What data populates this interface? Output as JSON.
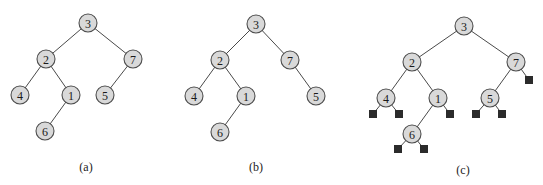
{
  "figure": {
    "style": {
      "node_fill": "#d9d9d9",
      "node_stroke": "#4d4d4d",
      "edge_color": "#4a4a4a",
      "null_leaf_color": "#2b2b2b",
      "node_radius": 9,
      "null_leaf_size": 8
    },
    "panels": [
      {
        "id": "a",
        "caption": "(a)",
        "caption_pos": [
          86,
          167
        ],
        "nodes": [
          {
            "id": "a3",
            "label": "3",
            "x": 88,
            "y": 23
          },
          {
            "id": "a2",
            "label": "2",
            "x": 46,
            "y": 59
          },
          {
            "id": "a7",
            "label": "7",
            "x": 133,
            "y": 59
          },
          {
            "id": "a4",
            "label": "4",
            "x": 20,
            "y": 95
          },
          {
            "id": "a1",
            "label": "1",
            "x": 71,
            "y": 95
          },
          {
            "id": "a5",
            "label": "5",
            "x": 105,
            "y": 95
          },
          {
            "id": "a6",
            "label": "6",
            "x": 45,
            "y": 131
          }
        ],
        "edges": [
          [
            "a3",
            "a2"
          ],
          [
            "a3",
            "a7"
          ],
          [
            "a2",
            "a4"
          ],
          [
            "a2",
            "a1"
          ],
          [
            "a7",
            "a5"
          ],
          [
            "a1",
            "a6"
          ]
        ],
        "null_leaves": []
      },
      {
        "id": "b",
        "caption": "(b)",
        "caption_pos": [
          256,
          167
        ],
        "nodes": [
          {
            "id": "b3",
            "label": "3",
            "x": 256,
            "y": 24
          },
          {
            "id": "b2",
            "label": "2",
            "x": 220,
            "y": 60
          },
          {
            "id": "b7",
            "label": "7",
            "x": 290,
            "y": 60
          },
          {
            "id": "b4",
            "label": "4",
            "x": 194,
            "y": 96
          },
          {
            "id": "b1",
            "label": "1",
            "x": 246,
            "y": 96
          },
          {
            "id": "b5",
            "label": "5",
            "x": 316,
            "y": 96
          },
          {
            "id": "b6",
            "label": "6",
            "x": 220,
            "y": 132
          }
        ],
        "edges": [
          [
            "b3",
            "b2"
          ],
          [
            "b3",
            "b7"
          ],
          [
            "b2",
            "b4"
          ],
          [
            "b2",
            "b1"
          ],
          [
            "b7",
            "b5"
          ],
          [
            "b1",
            "b6"
          ]
        ],
        "null_leaves": []
      },
      {
        "id": "c",
        "caption": "(c)",
        "caption_pos": [
          463,
          170
        ],
        "nodes": [
          {
            "id": "c3",
            "label": "3",
            "x": 464,
            "y": 26
          },
          {
            "id": "c2",
            "label": "2",
            "x": 412,
            "y": 62
          },
          {
            "id": "c7",
            "label": "7",
            "x": 516,
            "y": 62
          },
          {
            "id": "c4",
            "label": "4",
            "x": 386,
            "y": 98
          },
          {
            "id": "c1",
            "label": "1",
            "x": 438,
            "y": 98
          },
          {
            "id": "c5",
            "label": "5",
            "x": 490,
            "y": 98
          },
          {
            "id": "c6",
            "label": "6",
            "x": 412,
            "y": 134
          }
        ],
        "edges": [
          [
            "c3",
            "c2"
          ],
          [
            "c3",
            "c7"
          ],
          [
            "c2",
            "c4"
          ],
          [
            "c2",
            "c1"
          ],
          [
            "c7",
            "c5"
          ],
          [
            "c1",
            "c6"
          ]
        ],
        "null_leaves": [
          {
            "parent": "c4",
            "side": "left",
            "x": 373,
            "y": 114
          },
          {
            "parent": "c4",
            "side": "right",
            "x": 399,
            "y": 114
          },
          {
            "parent": "c1",
            "side": "right",
            "x": 450,
            "y": 114
          },
          {
            "parent": "c5",
            "side": "left",
            "x": 476,
            "y": 114
          },
          {
            "parent": "c5",
            "side": "right",
            "x": 502,
            "y": 114
          },
          {
            "parent": "c7",
            "side": "right",
            "x": 529,
            "y": 80
          },
          {
            "parent": "c6",
            "side": "left",
            "x": 398,
            "y": 149
          },
          {
            "parent": "c6",
            "side": "right",
            "x": 424,
            "y": 149
          }
        ]
      }
    ]
  }
}
